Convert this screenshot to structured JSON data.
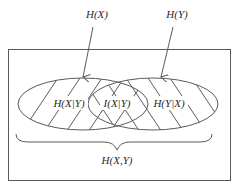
{
  "diagram": {
    "type": "venn-entropy",
    "labels": {
      "hx": "H(X)",
      "hy": "H(Y)",
      "hx_given_y": "H(X|Y)",
      "mutual_info": "I(X|Y)",
      "hy_given_x": "H(Y|X)",
      "joint": "H(X,Y)"
    },
    "colors": {
      "stroke": "#5a5a5a",
      "text": "#2a2a2a",
      "background": "#ffffff"
    }
  }
}
